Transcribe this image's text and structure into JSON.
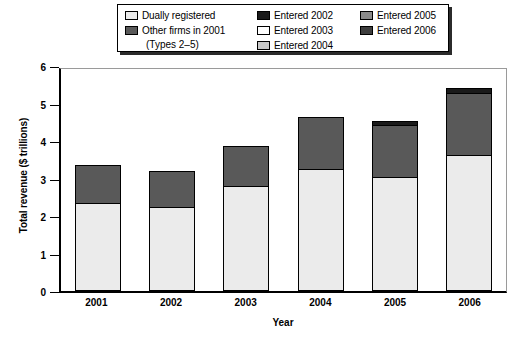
{
  "legend": {
    "columns": [
      {
        "entries": [
          {
            "label": "Dually registered",
            "color": "#ebebeb",
            "icon": "legend-swatch"
          },
          {
            "label": "Other firms in 2001",
            "color": "#595959",
            "icon": "legend-swatch"
          }
        ],
        "subnote": "(Types 2–5)"
      },
      {
        "entries": [
          {
            "label": "Entered 2002",
            "color": "#1a1a1a",
            "icon": "legend-swatch"
          },
          {
            "label": "Entered 2003",
            "color": "#ffffff",
            "icon": "legend-swatch"
          },
          {
            "label": "Entered 2004",
            "color": "#c9c9c9",
            "icon": "legend-swatch"
          }
        ]
      },
      {
        "entries": [
          {
            "label": "Entered 2005",
            "color": "#8a8a8a",
            "icon": "legend-swatch"
          },
          {
            "label": "Entered 2006",
            "color": "#3d3d3d",
            "icon": "legend-swatch"
          }
        ]
      }
    ]
  },
  "chart_data": {
    "type": "bar",
    "subtype": "stacked",
    "title": "",
    "xlabel": "Year",
    "ylabel": "Total revenue ($ trillions)",
    "categories": [
      "2001",
      "2002",
      "2003",
      "2004",
      "2005",
      "2006"
    ],
    "ylim": [
      0,
      6
    ],
    "yticks": [
      0,
      1,
      2,
      3,
      4,
      5,
      6
    ],
    "ytick_labels": [
      "0",
      "1",
      "2",
      "3",
      "4",
      "5",
      "6"
    ],
    "grid": false,
    "legend_position": "top",
    "series": [
      {
        "name": "Dually registered",
        "color": "#ebebeb",
        "values": [
          2.3,
          2.2,
          2.75,
          3.2,
          3.0,
          3.58
        ]
      },
      {
        "name": "Other firms in 2001 (Types 2-5)",
        "color": "#595959",
        "values": [
          0.97,
          0.93,
          1.05,
          1.37,
          1.35,
          1.62
        ]
      },
      {
        "name": "Entered 2002",
        "color": "#1a1a1a",
        "values": [
          0,
          0,
          0,
          0,
          0.08,
          0.1
        ]
      },
      {
        "name": "Entered 2003",
        "color": "#ffffff",
        "values": [
          0,
          0,
          0,
          0,
          0,
          0
        ]
      },
      {
        "name": "Entered 2004",
        "color": "#c9c9c9",
        "values": [
          0,
          0,
          0,
          0,
          0,
          0
        ]
      },
      {
        "name": "Entered 2005",
        "color": "#8a8a8a",
        "values": [
          0,
          0,
          0,
          0,
          0,
          0
        ]
      },
      {
        "name": "Entered 2006",
        "color": "#3d3d3d",
        "values": [
          0,
          0,
          0,
          0,
          0,
          0
        ]
      }
    ],
    "totals": [
      3.27,
      3.13,
      3.8,
      4.57,
      4.43,
      5.3
    ]
  }
}
